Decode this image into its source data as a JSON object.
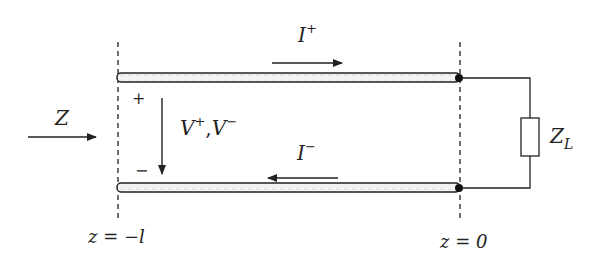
{
  "diagram": {
    "labels": {
      "input_impedance": "Z",
      "forward_current": "I",
      "forward_current_sup": "+",
      "reverse_current": "I",
      "reverse_current_sup": "−",
      "voltage_v": "V",
      "voltage_plus_sup": "+",
      "voltage_sep": ",",
      "voltage_v2": "V",
      "voltage_minus_sup": "−",
      "plus_sign": "+",
      "minus_sign": "−",
      "load": "Z",
      "load_sub": "L",
      "left_position": "z = −l",
      "right_position": "z = 0"
    },
    "colors": {
      "line": "#222222",
      "conductor_fill": "#e8e8e8"
    }
  }
}
